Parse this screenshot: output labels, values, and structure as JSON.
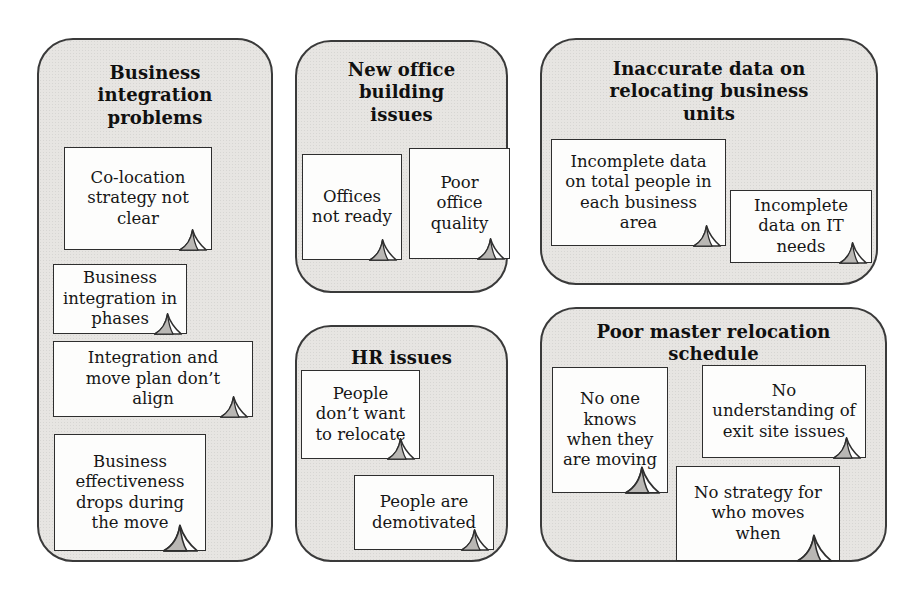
{
  "figure": {
    "type": "affinity-diagram",
    "background": "#ffffff",
    "colors": {
      "group_fill": "#e7e5e2",
      "group_border": "#3a3a3a",
      "note_fill": "#fdfdfc",
      "note_border": "#2e2e2e",
      "fold_fill": "#b9b7b4",
      "text": "#161616"
    }
  },
  "groups": [
    {
      "title": "Business\nintegration\nproblems",
      "notes": [
        {
          "text": "Co-location\nstrategy not\nclear"
        },
        {
          "text": "Business\nintegration in\nphases"
        },
        {
          "text": "Integration and\nmove plan don’t\nalign"
        },
        {
          "text": "Business\neffectiveness\ndrops during\nthe move"
        }
      ]
    },
    {
      "title": "New office\nbuilding\nissues",
      "notes": [
        {
          "text": "Offices\nnot ready"
        },
        {
          "text": "Poor\noffice\nquality"
        }
      ]
    },
    {
      "title": "Inaccurate data on\nrelocating business\nunits",
      "notes": [
        {
          "text": "Incomplete data\non total people in\neach business\narea"
        },
        {
          "text": "Incomplete\ndata on IT\nneeds"
        }
      ]
    },
    {
      "title": "HR issues",
      "notes": [
        {
          "text": "People\ndon’t want\nto relocate"
        },
        {
          "text": "People are\ndemotivated"
        }
      ]
    },
    {
      "title": "Poor master relocation\nschedule",
      "notes": [
        {
          "text": "No one\nknows\nwhen they\nare moving"
        },
        {
          "text": "No\nunderstanding of\nexit site issues"
        },
        {
          "text": "No strategy for\nwho moves\nwhen"
        }
      ]
    }
  ]
}
